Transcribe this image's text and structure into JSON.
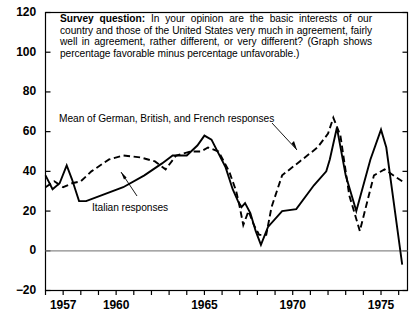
{
  "chart_data": {
    "type": "line",
    "title": "",
    "xlabel": "",
    "ylabel": "",
    "xlim": [
      1956,
      1976.5
    ],
    "ylim": [
      -20,
      120
    ],
    "ytick_values": [
      -20,
      0,
      20,
      40,
      60,
      80,
      100,
      120
    ],
    "ytick_labels": [
      "−20",
      "0",
      "20",
      "40",
      "60",
      "80",
      "100",
      "120"
    ],
    "xtick_values": [
      1956,
      1957,
      1958,
      1959,
      1960,
      1961,
      1962,
      1963,
      1964,
      1965,
      1966,
      1967,
      1968,
      1969,
      1970,
      1971,
      1972,
      1973,
      1974,
      1975,
      1976
    ],
    "xtick_labels_shown": [
      "1957",
      "1960",
      "1965",
      "1970",
      "1975"
    ],
    "xtick_labels_shown_values": [
      1957,
      1960,
      1965,
      1970,
      1975
    ],
    "grid": false,
    "zero_line": true,
    "legend_position": "inline-annotations",
    "series": [
      {
        "name": "Italian responses",
        "style": "solid",
        "color": "#000000",
        "x": [
          1956.0,
          1956.4,
          1956.8,
          1957.2,
          1957.5,
          1957.9,
          1958.3,
          1959.2,
          1960.4,
          1961.6,
          1962.6,
          1963.2,
          1964.0,
          1964.6,
          1965.0,
          1965.4,
          1966.2,
          1966.6,
          1966.9,
          1967.1,
          1967.3,
          1967.6,
          1967.9,
          1968.2,
          1968.6,
          1969.4,
          1970.2,
          1971.2,
          1971.9,
          1972.1,
          1972.5,
          1973.0,
          1973.6,
          1974.4,
          1975.0,
          1975.3,
          1976.2
        ],
        "y": [
          38,
          31,
          34,
          43,
          36,
          25,
          25,
          28,
          32,
          38,
          44,
          48,
          48,
          53,
          58,
          56,
          42,
          31,
          25,
          22,
          24,
          19,
          10,
          3,
          12,
          20,
          21,
          33,
          40,
          46,
          62,
          38,
          20,
          46,
          61,
          52,
          -7
        ]
      },
      {
        "name": "Mean of German, British, and French responses",
        "style": "dashed",
        "color": "#000000",
        "x": [
          1956.0,
          1956.5,
          1957.0,
          1957.5,
          1958.0,
          1958.6,
          1959.6,
          1960.4,
          1961.4,
          1962.2,
          1962.8,
          1963.4,
          1964.2,
          1964.8,
          1965.2,
          1965.8,
          1966.4,
          1966.8,
          1967.0,
          1967.2,
          1967.5,
          1967.8,
          1968.1,
          1968.5,
          1968.8,
          1969.4,
          1970.4,
          1971.4,
          1972.0,
          1972.3,
          1972.7,
          1973.2,
          1973.8,
          1974.6,
          1975.2,
          1976.2
        ],
        "y": [
          32,
          35,
          32,
          34,
          35,
          40,
          46,
          48,
          47,
          45,
          41,
          48,
          50,
          50,
          52,
          50,
          40,
          30,
          22,
          13,
          20,
          13,
          8,
          8,
          22,
          38,
          45,
          52,
          59,
          67,
          58,
          28,
          10,
          38,
          41,
          35
        ]
      }
    ],
    "annotations": [
      {
        "id": "mean-label",
        "text": "Mean of German, British, and French responses",
        "leader": true
      },
      {
        "id": "italian-label",
        "text": "Italian responses",
        "leader": true
      }
    ]
  },
  "question": {
    "label": "Survey question:",
    "body": " In your opinion are the basic interests of our country and those of the United States very much in agreement, fairly well in agreement, rather different, or very different? (Graph shows percentage favorable minus percentage unfavorable.)"
  },
  "style": {
    "axis_color": "#000000",
    "zero_line_color": "#8a8a8a",
    "line_color": "#000000",
    "background": "#ffffff"
  }
}
